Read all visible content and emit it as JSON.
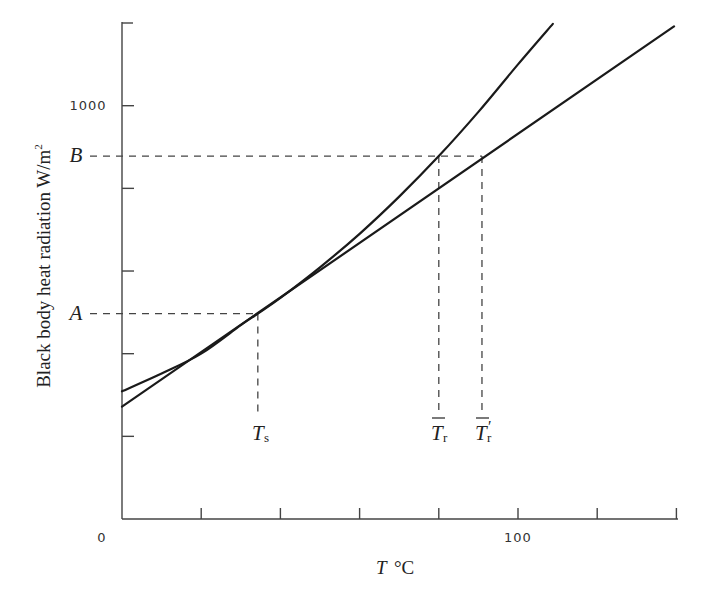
{
  "chart_data": {
    "type": "line",
    "title": "",
    "xlabel": "T °C",
    "ylabel": "Black body heat radiation W/m²",
    "xlim": [
      0,
      140
    ],
    "ylim": [
      0,
      1200
    ],
    "grid": false,
    "legend": null,
    "x_ticks": [
      0,
      20,
      40,
      60,
      80,
      100,
      120,
      140
    ],
    "x_tick_labels": [
      {
        "value": 0,
        "label": "0"
      },
      {
        "value": 100,
        "label": "100"
      }
    ],
    "y_ticks": [
      0,
      200,
      400,
      600,
      800,
      1000
    ],
    "y_tick_labels": [
      {
        "value": 1000,
        "label": "1000"
      }
    ],
    "series": [
      {
        "name": "black body radiation curve",
        "style": "solid",
        "x": [
          0,
          10,
          20,
          30,
          34.3,
          40,
          50,
          60,
          70,
          80,
          90,
          100,
          108.8
        ],
        "y": [
          309,
          352,
          400,
          469,
          497,
          535,
          609,
          690,
          780,
          878,
          985,
          1100,
          1198
        ]
      },
      {
        "name": "linear approximation (tangent at Ts)",
        "style": "solid",
        "x": [
          0,
          139.4
        ],
        "y": [
          272,
          1192
        ]
      }
    ],
    "annotations": [
      {
        "label": "A",
        "type": "y-level",
        "y": 497,
        "x_end": 34.3,
        "style": "dashed"
      },
      {
        "label": "B",
        "type": "y-level",
        "y": 878,
        "x_end": 90.9,
        "style": "dashed"
      },
      {
        "label": "Ts",
        "main": "T",
        "sub": "s",
        "overbar": false,
        "prime": false,
        "type": "x-drop",
        "x": 34.3,
        "y_from": 497
      },
      {
        "label": "T̄r",
        "main": "T",
        "sub": "r",
        "overbar": true,
        "prime": false,
        "type": "x-drop",
        "x": 80.0,
        "y_from": 878
      },
      {
        "label": "T̄′r",
        "main": "T",
        "sub": "r",
        "overbar": true,
        "prime": true,
        "type": "x-drop",
        "x": 90.9,
        "y_from": 878
      }
    ]
  },
  "labels": {
    "xlabel_main": "T",
    "xlabel_unit": "°C",
    "ylabel_text": "Black body heat radiation W/m",
    "ylabel_sup": "2",
    "tick_0": "0",
    "tick_100": "100",
    "tick_1000": "1000",
    "mark_A": "A",
    "mark_B": "B",
    "ts_main": "T",
    "ts_sub": "s",
    "tr_main": "T",
    "tr_sub": "r",
    "trp_main": "T",
    "trp_prime": "′",
    "trp_sub": "r"
  }
}
